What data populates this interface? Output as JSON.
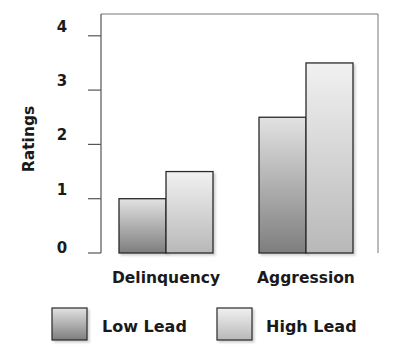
{
  "chart_data": {
    "type": "bar",
    "title": "",
    "xlabel": "",
    "ylabel": "Ratings",
    "ylim": [
      0,
      4.5
    ],
    "yticks": [
      0,
      1,
      2,
      3,
      4
    ],
    "categories": [
      "Delinquency",
      "Aggression"
    ],
    "series": [
      {
        "name": "Low Lead",
        "values": [
          1.0,
          2.5
        ]
      },
      {
        "name": "High Lead",
        "values": [
          1.5,
          3.5
        ]
      }
    ],
    "grid": false,
    "legend_position": "bottom"
  },
  "colors": {
    "low_lead_top": "#e2e2e2",
    "low_lead_bottom": "#7e7e7e",
    "high_lead_top": "#f1f1f1",
    "high_lead_bottom": "#b8b8b8",
    "axis": "#555555",
    "bar_border": "#2a2a2a"
  }
}
